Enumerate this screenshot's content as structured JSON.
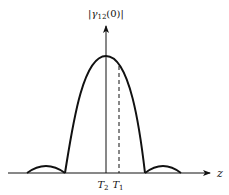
{
  "diagram": {
    "type": "sinc-like coherence curve",
    "y_axis_label": {
      "prefix": "|",
      "symbol": "γ",
      "subscript": "12",
      "suffix": "(0)|"
    },
    "x_axis_label": "z",
    "markers": [
      {
        "symbol": "T",
        "subscript": "2",
        "x_px": 106,
        "note": "center, solid axis"
      },
      {
        "symbol": "T",
        "subscript": "1",
        "x_px": 119,
        "note": "dashed line"
      }
    ],
    "colors": {
      "line": "#111111",
      "background": "#ffffff"
    },
    "geometry": {
      "axis_origin_y": 173,
      "vertical_axis_x": 106,
      "vertical_axis_top": 25,
      "horizontal_axis_left": 8,
      "horizontal_axis_right": 210,
      "peak_y": 56,
      "main_lobe_left_x": 65,
      "main_lobe_right_x": 145,
      "side_lobe_left": [
        27,
        65
      ],
      "side_lobe_right": [
        145,
        181
      ],
      "side_lobe_peak_y": 167
    }
  }
}
